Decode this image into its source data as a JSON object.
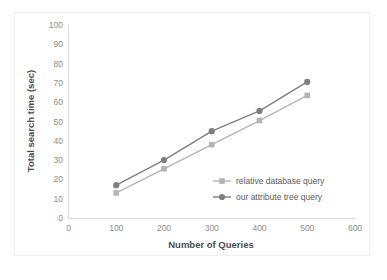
{
  "chart_data": {
    "type": "line",
    "title": "",
    "subtitle": "",
    "xlabel": "Number of Queries",
    "ylabel": "Total search time (sec)",
    "x": [
      100,
      200,
      300,
      400,
      500
    ],
    "xlim": [
      0,
      600
    ],
    "ylim": [
      0,
      100
    ],
    "xticks": [
      0,
      100,
      200,
      300,
      400,
      500,
      600
    ],
    "yticks": [
      0,
      10,
      20,
      30,
      40,
      50,
      60,
      70,
      80,
      90,
      100
    ],
    "xtick_labels": [
      "0",
      "100",
      "200",
      "300",
      "400",
      "500",
      "600"
    ],
    "ytick_labels": [
      "0",
      "10",
      "20",
      "30",
      "40",
      "50",
      "60",
      "70",
      "80",
      "90",
      "100"
    ],
    "grid": false,
    "legend_position": "inside-lower-right",
    "series": [
      {
        "name": "relative database query",
        "values": [
          13,
          25.5,
          38,
          50.5,
          63.5
        ],
        "color": "#b4b4b4",
        "marker": "square"
      },
      {
        "name": "our attribute tree query",
        "values": [
          17,
          30,
          45,
          55.5,
          70.5
        ],
        "color": "#7f7f7f",
        "marker": "circle"
      }
    ]
  },
  "legend": {
    "items": [
      {
        "label": "relative database query"
      },
      {
        "label": "our attribute tree query"
      }
    ]
  },
  "axes": {
    "x_title": "Number of Queries",
    "y_title": "Total search time (sec)"
  }
}
